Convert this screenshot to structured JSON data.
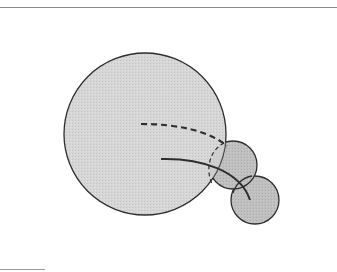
{
  "figure": {
    "colors": {
      "big_fill": "#d6d6d6",
      "small_fill": "#bfbfbf",
      "overlap_fill": "#b3b3b3",
      "stroke": "#2e2e2e",
      "rule": "#8a8a8a"
    },
    "big_circle": {
      "cx": 145,
      "cy": 134,
      "r": 81
    },
    "small_circle_upper": {
      "cx": 233,
      "cy": 165,
      "r": 24
    },
    "small_circle_lower": {
      "cx": 255,
      "cy": 200,
      "r": 24
    },
    "dashed_path": "M141,124 C175,124 208,130 227,146",
    "hidden_arc_path": "M224,143 C210,150 205,168 212,184",
    "solid_path": "M161,159 C200,158 240,170 250,200"
  }
}
